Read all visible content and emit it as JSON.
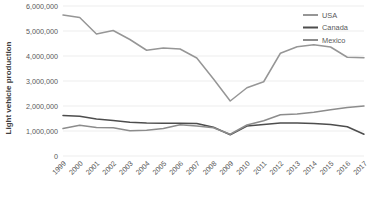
{
  "chart_data": {
    "type": "line",
    "title": "",
    "xlabel": "",
    "ylabel": "Light vehicle production",
    "ylim": [
      0,
      6000000
    ],
    "ytick_labels": [
      "0",
      "1,000,000",
      "2,000,000",
      "3,000,000",
      "4,000,000",
      "5,000,000",
      "6,000,000"
    ],
    "ytick_values": [
      0,
      1000000,
      2000000,
      3000000,
      4000000,
      5000000,
      6000000
    ],
    "grid": true,
    "legend_position": "top-right",
    "categories": [
      "1999",
      "2000",
      "2001",
      "2002",
      "2003",
      "2004",
      "2005",
      "2006",
      "2007",
      "2008",
      "2009",
      "2010",
      "2011",
      "2012",
      "2013",
      "2014",
      "2015",
      "2016",
      "2017"
    ],
    "series": [
      {
        "name": "USA",
        "color": "#969696",
        "values": [
          5640000,
          5540000,
          4880000,
          5020000,
          4660000,
          4230000,
          4320000,
          4280000,
          3920000,
          3080000,
          2200000,
          2730000,
          2970000,
          4110000,
          4370000,
          4450000,
          4360000,
          3950000,
          3930000
        ]
      },
      {
        "name": "Canada",
        "color": "#4d4d4d",
        "values": [
          1620000,
          1590000,
          1480000,
          1420000,
          1350000,
          1320000,
          1310000,
          1310000,
          1300000,
          1150000,
          850000,
          1200000,
          1260000,
          1320000,
          1320000,
          1300000,
          1260000,
          1170000,
          870000
        ]
      },
      {
        "name": "Mexico",
        "color": "#8c8c8c",
        "values": [
          1100000,
          1230000,
          1140000,
          1130000,
          1010000,
          1030000,
          1100000,
          1250000,
          1200000,
          1130000,
          870000,
          1240000,
          1410000,
          1650000,
          1680000,
          1750000,
          1850000,
          1940000,
          2000000
        ]
      }
    ]
  },
  "legend": {
    "items": [
      {
        "label": "USA",
        "color": "#969696"
      },
      {
        "label": "Canada",
        "color": "#4d4d4d"
      },
      {
        "label": "Mexico",
        "color": "#8c8c8c"
      }
    ]
  },
  "axes": {
    "y_title": "Light vehicle production"
  }
}
